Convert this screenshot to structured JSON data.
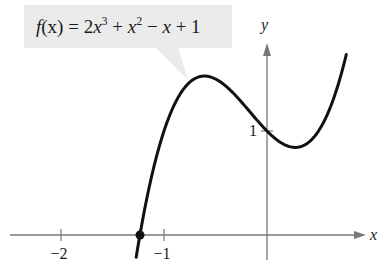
{
  "chart_data": {
    "type": "line",
    "title": "",
    "function": "2x^3 + x^2 - x + 1",
    "coefficients": [
      2,
      1,
      -1,
      1
    ],
    "callout": {
      "prefix": "f",
      "arg": "(x)",
      "eq": " = 2",
      "x1": "x",
      "p3": "3",
      "plus1": " + ",
      "x2": "x",
      "p2": "2",
      "minus": " − ",
      "x3": "x",
      "tail": " + 1"
    },
    "xlabel": "x",
    "ylabel": "y",
    "x_domain": [
      -1.27,
      0.77
    ],
    "xlim": [
      -2.5,
      1.0
    ],
    "ylim": [
      -0.25,
      2.0
    ],
    "x_ticks": [
      {
        "value": -2,
        "label": "−2"
      },
      {
        "value": -1,
        "label": "−1"
      }
    ],
    "y_ticks": [
      {
        "value": 1,
        "label": "1"
      }
    ],
    "marked_point": {
      "x": -1.233,
      "y": 0,
      "label": "x-intercept"
    },
    "grid": false,
    "colors": {
      "curve": "#111111",
      "axis": "#777777",
      "callout_bg": "#ebebeb"
    }
  }
}
